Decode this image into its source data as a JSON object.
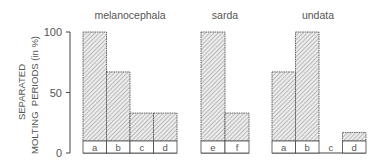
{
  "chart_data": {
    "type": "bar",
    "ylabel_line1": "SEPARATED",
    "ylabel_line2": "MOLTING  PERIODS (in %)",
    "ylim": [
      0,
      100
    ],
    "yticks": [
      {
        "value": 0,
        "label": "0"
      },
      {
        "value": 50,
        "label": "50"
      },
      {
        "value": 100,
        "label": "100"
      }
    ],
    "grid": false,
    "groups": [
      {
        "name": "melanocephala",
        "categories": [
          "a",
          "b",
          "c",
          "d"
        ],
        "values": [
          100,
          67,
          33,
          33
        ]
      },
      {
        "name": "sarda",
        "categories": [
          "e",
          "f"
        ],
        "values": [
          100,
          33
        ]
      },
      {
        "name": "undata",
        "categories": [
          "a",
          "b",
          "c",
          "d"
        ],
        "values": [
          67,
          100,
          0,
          17
        ]
      }
    ]
  },
  "colors": {
    "bar_fill": "#e4e4e4",
    "hatch": "#8a8a8a",
    "stroke": "#444444",
    "text": "#555555"
  }
}
